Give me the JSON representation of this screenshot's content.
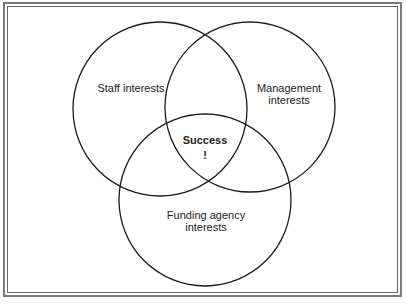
{
  "diagram": {
    "type": "venn",
    "sets": [
      {
        "id": "staff",
        "label": "Staff interests",
        "cx": 160,
        "cy": 109,
        "r": 87
      },
      {
        "id": "management",
        "label_line1": "Management",
        "label_line2": "interests",
        "cx": 250,
        "cy": 107,
        "r": 85
      },
      {
        "id": "funding",
        "label_line1": "Funding agency",
        "label_line2": "interests",
        "cx": 205,
        "cy": 200,
        "r": 86
      }
    ],
    "intersection": {
      "label_line1": "Success",
      "label_line2": "!"
    },
    "colors": {
      "stroke": "#1a1a1a",
      "frame": "#7a7a7a",
      "background": "#ffffff"
    }
  }
}
